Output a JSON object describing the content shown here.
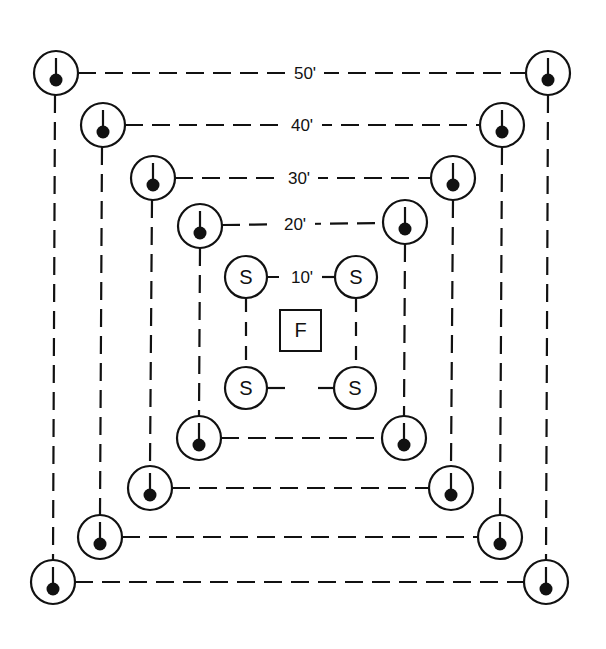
{
  "diagram": {
    "type": "concentric sampling grid",
    "center_label": "F",
    "inner_node_label": "S",
    "rings": [
      {
        "label": "10'",
        "node_type": "S"
      },
      {
        "label": "20'",
        "node_type": "stake"
      },
      {
        "label": "30'",
        "node_type": "stake"
      },
      {
        "label": "40'",
        "node_type": "stake"
      },
      {
        "label": "50'",
        "node_type": "stake"
      }
    ],
    "colors": {
      "ink": "#111111",
      "background": "#ffffff"
    }
  }
}
